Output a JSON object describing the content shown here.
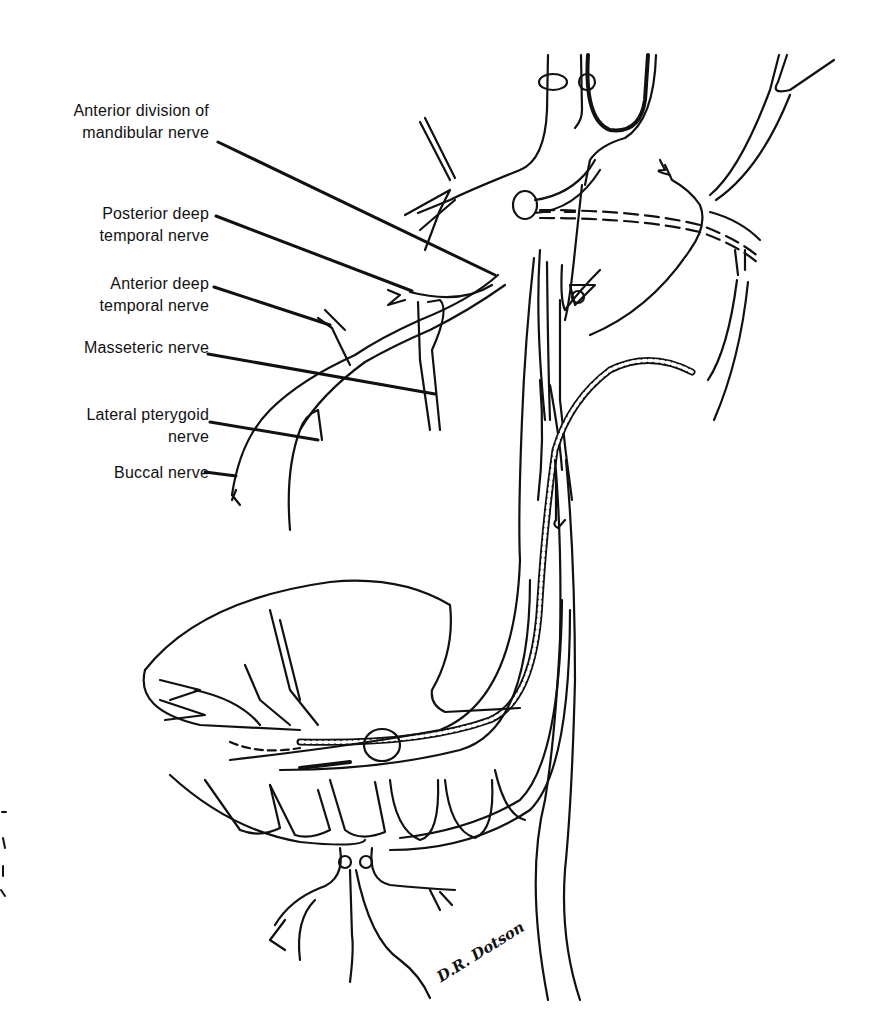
{
  "figure": {
    "background_color": "#ffffff",
    "line_color": "#111111",
    "labels": [
      {
        "id": "anterior-division",
        "lines": [
          "Anterior division of",
          "mandibular nerve"
        ]
      },
      {
        "id": "posterior-deep-temporal",
        "lines": [
          "Posterior deep",
          "temporal nerve"
        ]
      },
      {
        "id": "anterior-deep-temporal",
        "lines": [
          "Anterior deep",
          "temporal nerve"
        ]
      },
      {
        "id": "masseteric",
        "lines": [
          "Masseteric nerve"
        ]
      },
      {
        "id": "lateral-pterygoid",
        "lines": [
          "Lateral pterygoid",
          "nerve"
        ]
      },
      {
        "id": "buccal",
        "lines": [
          "Buccal nerve"
        ]
      }
    ],
    "signature": "D.R. Dotson"
  }
}
